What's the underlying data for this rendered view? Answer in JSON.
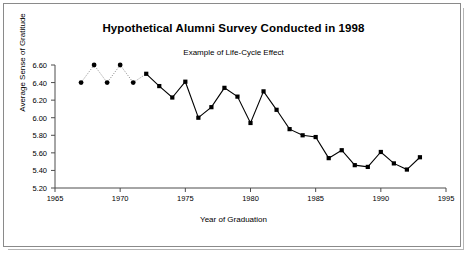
{
  "chart_data": {
    "type": "line",
    "title": "Hypothetical Alumni Survey Conducted in 1998",
    "subtitle": "Example of Life-Cycle Effect",
    "xlabel": "Year of Graduation",
    "ylabel": "Average Sense of Gratitude",
    "xlim": [
      1965,
      1995
    ],
    "ylim": [
      5.2,
      6.6
    ],
    "grid": false,
    "legend": "none",
    "xticks": [
      "1965",
      "1970",
      "1975",
      "1980",
      "1985",
      "1990",
      "1995"
    ],
    "xtick_values": [
      1965,
      1970,
      1975,
      1980,
      1985,
      1990,
      1995
    ],
    "yticks": [
      "5.20",
      "5.40",
      "5.60",
      "5.80",
      "6.00",
      "6.20",
      "6.40",
      "6.60"
    ],
    "ytick_values": [
      5.2,
      5.4,
      5.6,
      5.8,
      6.0,
      6.2,
      6.4,
      6.6
    ],
    "marker_color": "#000000",
    "line_color": "#000000",
    "x": [
      1967,
      1968,
      1969,
      1970,
      1971,
      1972,
      1973,
      1974,
      1975,
      1976,
      1977,
      1978,
      1979,
      1980,
      1981,
      1982,
      1983,
      1984,
      1985,
      1986,
      1987,
      1988,
      1989,
      1990,
      1991,
      1992,
      1993
    ],
    "values": [
      6.4,
      6.6,
      6.4,
      6.6,
      6.4,
      6.5,
      6.36,
      6.23,
      6.41,
      6.0,
      6.12,
      6.34,
      6.24,
      5.94,
      6.3,
      6.09,
      5.87,
      5.8,
      5.78,
      5.54,
      5.63,
      5.46,
      5.44,
      5.61,
      5.48,
      5.41,
      5.55
    ],
    "segments": [
      {
        "style": "dotted",
        "marker": "circle",
        "from_index": 0,
        "to_index": 4
      },
      {
        "style": "solid",
        "marker": "square",
        "from_index": 5,
        "to_index": 26
      }
    ]
  }
}
